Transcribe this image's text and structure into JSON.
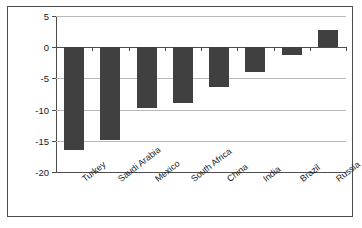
{
  "chart_data": {
    "type": "bar",
    "title": "",
    "subtitle": "",
    "xlabel": "",
    "ylabel": "Change, 1995–2012",
    "categories": [
      "Turkey",
      "Saudi Arabia",
      "Mexico",
      "South Africa",
      "China",
      "India",
      "Brazil",
      "Russia"
    ],
    "values": [
      -16.4,
      -14.8,
      -9.8,
      -8.9,
      -6.4,
      -4.0,
      -1.3,
      2.7
    ],
    "series": [
      {
        "name": "Change, 1995–2012",
        "values": [
          -16.4,
          -14.8,
          -9.8,
          -8.9,
          -6.4,
          -4.0,
          -1.3,
          2.7
        ]
      }
    ],
    "ylim": [
      -20,
      5
    ],
    "yticks": [
      5,
      0,
      -5,
      -10,
      -15,
      -20
    ],
    "ytick_labels": [
      "5",
      "0",
      "-5",
      "-10",
      "-15",
      "-20"
    ],
    "grid": true,
    "grid_axis": "y",
    "legend": false,
    "legend_position": "none",
    "bar_color": "#404040",
    "axis_color": "#4d4d4d",
    "gridline_color": "#b9b9b9",
    "background_color": "#ffffff",
    "frame": true
  }
}
